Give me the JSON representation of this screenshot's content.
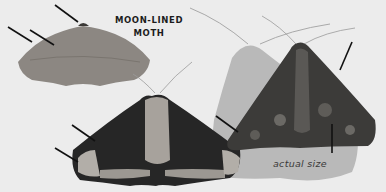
{
  "figure": {
    "title_line1": "MOON-LINED",
    "title_line2": "MOTH",
    "caption": "actual size",
    "subjects": [
      {
        "name": "moth-plain-gray",
        "description": "Moon-lined moth, uniform gray-brown form"
      },
      {
        "name": "moth-dark-banded",
        "description": "Moon-lined moth with dark wings and pale bands"
      },
      {
        "name": "moth-mottled-actual-size",
        "description": "Moon-lined moth, mottled form shown at actual size with shadow"
      }
    ],
    "colors": {
      "background": "#ececec",
      "shadow": "#b9b9b9",
      "plain_moth": "#8c8782",
      "dark_moth": "#262626",
      "pale_band": "#b2aea8",
      "mottled_moth": "#3c3b39",
      "arrow": "#111111"
    }
  }
}
